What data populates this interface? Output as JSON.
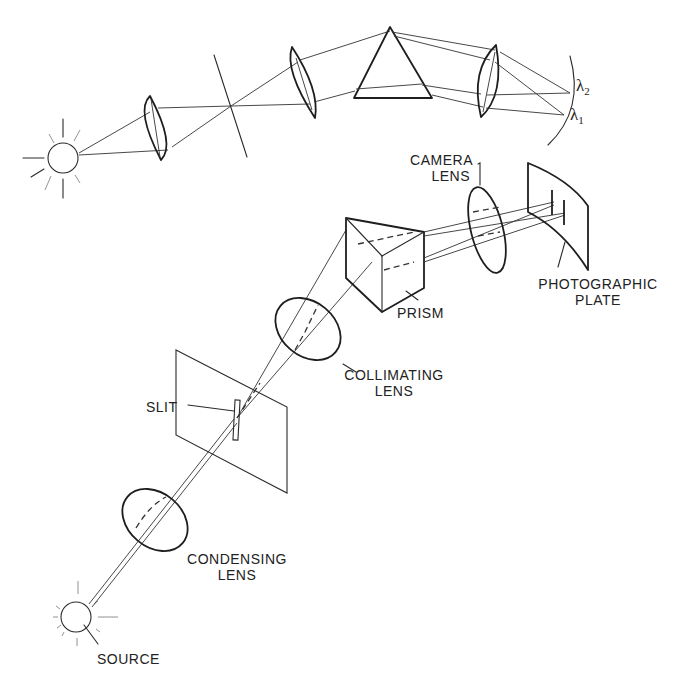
{
  "diagram": {
    "colors": {
      "ink": "#222222",
      "background": "#ffffff"
    },
    "top_schematic": {
      "wavelength_labels": [
        {
          "symbol": "λ",
          "subscript": "2"
        },
        {
          "symbol": "λ",
          "subscript": "1"
        }
      ],
      "components": [
        "source",
        "lens",
        "slit",
        "lens",
        "prism",
        "lens",
        "focal plane"
      ]
    },
    "labels": {
      "camera_lens_line1": "CAMERA",
      "camera_lens_line2": "LENS",
      "photographic_plate_line1": "PHOTOGRAPHIC",
      "photographic_plate_line2": "PLATE",
      "prism": "PRISM",
      "collimating_lens_line1": "COLLIMATING",
      "collimating_lens_line2": "LENS",
      "slit": "SLIT",
      "condensing_lens_line1": "CONDENSING",
      "condensing_lens_line2": "LENS",
      "source": "SOURCE"
    }
  }
}
